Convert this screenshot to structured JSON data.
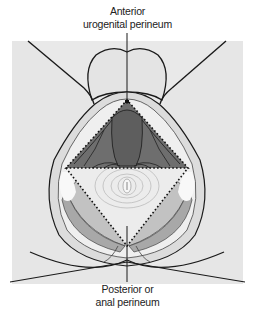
{
  "diagram": {
    "type": "anatomical illustration",
    "labels": {
      "anterior_line1": "Anterior",
      "anterior_line2": "urogenital perineum",
      "posterior_line1": "Posterior or",
      "posterior_line2": "anal perineum"
    },
    "regions": [
      {
        "name": "Anterior urogenital perineum",
        "shape": "triangle",
        "fill": "#6e6e6e"
      },
      {
        "name": "Posterior anal perineum",
        "shape": "triangle",
        "fill": "#e6e6e6"
      }
    ],
    "colors": {
      "background": "#e9e9e9",
      "skin": "#e4e4e4",
      "dark_muscle": "#6a6a6a",
      "mid_muscle": "#9a9a9a",
      "light_tissue": "#cfcfcf",
      "outline": "#1a1a1a"
    }
  }
}
